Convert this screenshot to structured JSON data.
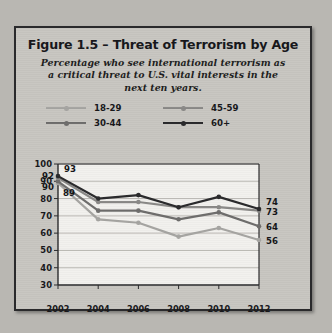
{
  "figure": {
    "title": "Figure 1.5 – Threat of Terrorism by Age",
    "subtitle": "Percentage who see international terrorism as a critical threat to U.S. vital interests in the next ten years."
  },
  "colors": {
    "background": "#b9b7b2",
    "card_background": "#c8c6c1",
    "card_border": "#2a2a2c",
    "plot_background": "#f2f1ee",
    "gridline": "#b5b3ae",
    "series_18_29": "#a6a5a2",
    "series_30_44": "#6e6d6c",
    "series_45_59": "#8a8987",
    "series_60_plus": "#29292b"
  },
  "legend": {
    "items": [
      {
        "label": "18-29",
        "color_key": "series_18_29"
      },
      {
        "label": "45-59",
        "color_key": "series_45_59"
      },
      {
        "label": "30-44",
        "color_key": "series_30_44"
      },
      {
        "label": "60+",
        "color_key": "series_60_plus"
      }
    ]
  },
  "axes": {
    "y_ticks": [
      "100",
      "90",
      "80",
      "70",
      "60",
      "50",
      "40",
      "30"
    ],
    "x_ticks": [
      "2002",
      "2004",
      "2006",
      "2008",
      "2010",
      "2012"
    ]
  },
  "point_labels": {
    "left": [
      "93",
      "92",
      "90",
      "89"
    ],
    "right": [
      "74",
      "73",
      "64",
      "56"
    ]
  },
  "chart_data": {
    "type": "line",
    "title": "Figure 1.5 – Threat of Terrorism by Age",
    "subtitle": "Percentage who see international terrorism as a critical threat to U.S. vital interests in the next ten years.",
    "xlabel": "",
    "ylabel": "",
    "categories": [
      "2002",
      "2004",
      "2006",
      "2008",
      "2010",
      "2012"
    ],
    "x": [
      2002,
      2004,
      2006,
      2008,
      2010,
      2012
    ],
    "ylim": [
      30,
      100
    ],
    "ytick_step": 10,
    "grid": "horizontal",
    "legend_position": "above-plot",
    "series": [
      {
        "name": "18-29",
        "color": "#a6a5a2",
        "values": [
          89,
          68,
          66,
          58,
          63,
          56
        ],
        "label_start": "89",
        "label_end": "56"
      },
      {
        "name": "30-44",
        "color": "#6e6d6c",
        "values": [
          90,
          73,
          73,
          68,
          72,
          64
        ],
        "label_start": "90",
        "label_end": "64"
      },
      {
        "name": "45-59",
        "color": "#8a8987",
        "values": [
          92,
          78,
          78,
          75,
          75,
          73
        ],
        "label_start": "92",
        "label_end": "73"
      },
      {
        "name": "60+",
        "color": "#29292b",
        "values": [
          93,
          80,
          82,
          75,
          81,
          74
        ],
        "label_start": "93",
        "label_end": "74"
      }
    ]
  }
}
